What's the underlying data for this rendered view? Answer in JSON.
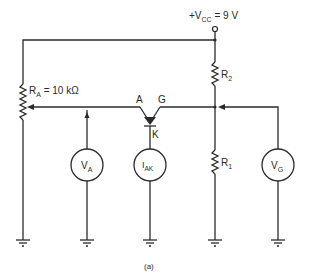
{
  "diagram": {
    "type": "circuit-schematic",
    "caption": "(a)",
    "supply": {
      "prefix": "+V",
      "subscript": "CC",
      "value": " = 9 V"
    },
    "components": {
      "pot": {
        "label": "R",
        "subscript": "A",
        "value": " = 10 kΩ"
      },
      "r2": {
        "label": "R",
        "subscript": "2"
      },
      "r1": {
        "label": "R",
        "subscript": "1"
      },
      "scr": {
        "anode": "A",
        "gate": "G",
        "cathode": "K"
      },
      "meter_va": {
        "label": "V",
        "subscript": "A"
      },
      "meter_iak": {
        "label": "I",
        "subscript": "AK"
      },
      "meter_vg": {
        "label": "V",
        "subscript": "G"
      }
    },
    "colors": {
      "line": "#2a2a2a",
      "background": "#ffffff"
    }
  }
}
